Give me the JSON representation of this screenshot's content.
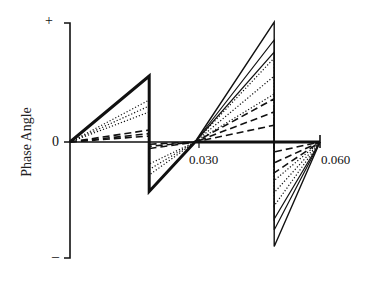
{
  "chart_data": {
    "type": "line",
    "title": "",
    "xlabel": "",
    "ylabel": "Phase Angle",
    "x_ticks": [
      "0.030",
      "0.060"
    ],
    "y_ticks": [
      "+",
      "0",
      "–"
    ],
    "xlim": [
      0,
      0.06
    ],
    "ylim": [
      "-",
      "+"
    ],
    "grid": false,
    "legend": "none",
    "series": [
      {
        "name": "solid-thick",
        "style": "solid",
        "width": 3,
        "points": [
          [
            0,
            0
          ],
          [
            0.019,
            0.55
          ],
          [
            0.019,
            -0.45
          ],
          [
            0.03,
            0
          ],
          [
            0.06,
            0
          ]
        ]
      },
      {
        "name": "solid-1",
        "style": "solid",
        "width": 1.4,
        "points": [
          [
            0.03,
            0
          ],
          [
            0.049,
            1.0
          ],
          [
            0.049,
            -0.95
          ],
          [
            0.06,
            0
          ]
        ]
      },
      {
        "name": "solid-2",
        "style": "solid",
        "width": 1.2,
        "points": [
          [
            0.03,
            0
          ],
          [
            0.049,
            0.85
          ],
          [
            0.049,
            -0.8
          ],
          [
            0.06,
            0
          ]
        ]
      },
      {
        "name": "solid-3",
        "style": "solid",
        "width": 1.2,
        "points": [
          [
            0.03,
            0
          ],
          [
            0.049,
            0.75
          ],
          [
            0.049,
            -0.7
          ],
          [
            0.06,
            0
          ]
        ]
      },
      {
        "name": "dotted-1",
        "style": "dotted",
        "width": 1.2,
        "points": [
          [
            0,
            0
          ],
          [
            0.019,
            0.35
          ],
          [
            0.019,
            -0.3
          ],
          [
            0.03,
            0
          ],
          [
            0.049,
            0.7
          ],
          [
            0.049,
            -0.58
          ],
          [
            0.06,
            0
          ]
        ]
      },
      {
        "name": "dotted-2",
        "style": "dotted",
        "width": 1.2,
        "points": [
          [
            0,
            0
          ],
          [
            0.019,
            0.3
          ],
          [
            0.019,
            -0.25
          ],
          [
            0.03,
            0
          ],
          [
            0.049,
            0.55
          ],
          [
            0.049,
            -0.46
          ],
          [
            0.06,
            0
          ]
        ]
      },
      {
        "name": "dotted-3",
        "style": "dotted",
        "width": 1.2,
        "points": [
          [
            0,
            0
          ],
          [
            0.019,
            0.25
          ],
          [
            0.019,
            -0.2
          ],
          [
            0.03,
            0
          ],
          [
            0.049,
            0.4
          ],
          [
            0.049,
            -0.35
          ],
          [
            0.06,
            0
          ]
        ]
      },
      {
        "name": "dashed-1",
        "style": "dashed",
        "width": 1.6,
        "points": [
          [
            0,
            0
          ],
          [
            0.019,
            0.1
          ],
          [
            0.019,
            -0.06
          ],
          [
            0.03,
            0
          ],
          [
            0.049,
            0.36
          ],
          [
            0.049,
            -0.28
          ],
          [
            0.06,
            0
          ]
        ]
      },
      {
        "name": "dashed-2",
        "style": "dashed",
        "width": 1.6,
        "points": [
          [
            0,
            0
          ],
          [
            0.019,
            0.07
          ],
          [
            0.019,
            -0.04
          ],
          [
            0.03,
            0
          ],
          [
            0.049,
            0.25
          ],
          [
            0.049,
            -0.19
          ],
          [
            0.06,
            0
          ]
        ]
      },
      {
        "name": "dashed-3",
        "style": "dashed",
        "width": 1.6,
        "points": [
          [
            0,
            0
          ],
          [
            0.019,
            0.05
          ],
          [
            0.019,
            -0.02
          ],
          [
            0.03,
            0
          ],
          [
            0.049,
            0.14
          ],
          [
            0.049,
            -0.09
          ],
          [
            0.06,
            0
          ]
        ]
      }
    ]
  },
  "labels": {
    "y_plus": "+",
    "y_zero": "0",
    "y_minus": "–",
    "x_tick_1": "0.030",
    "x_tick_2": "0.060",
    "y_axis_title": "Phase Angle"
  },
  "colors": {
    "ink": "#111111",
    "background": "#ffffff"
  }
}
